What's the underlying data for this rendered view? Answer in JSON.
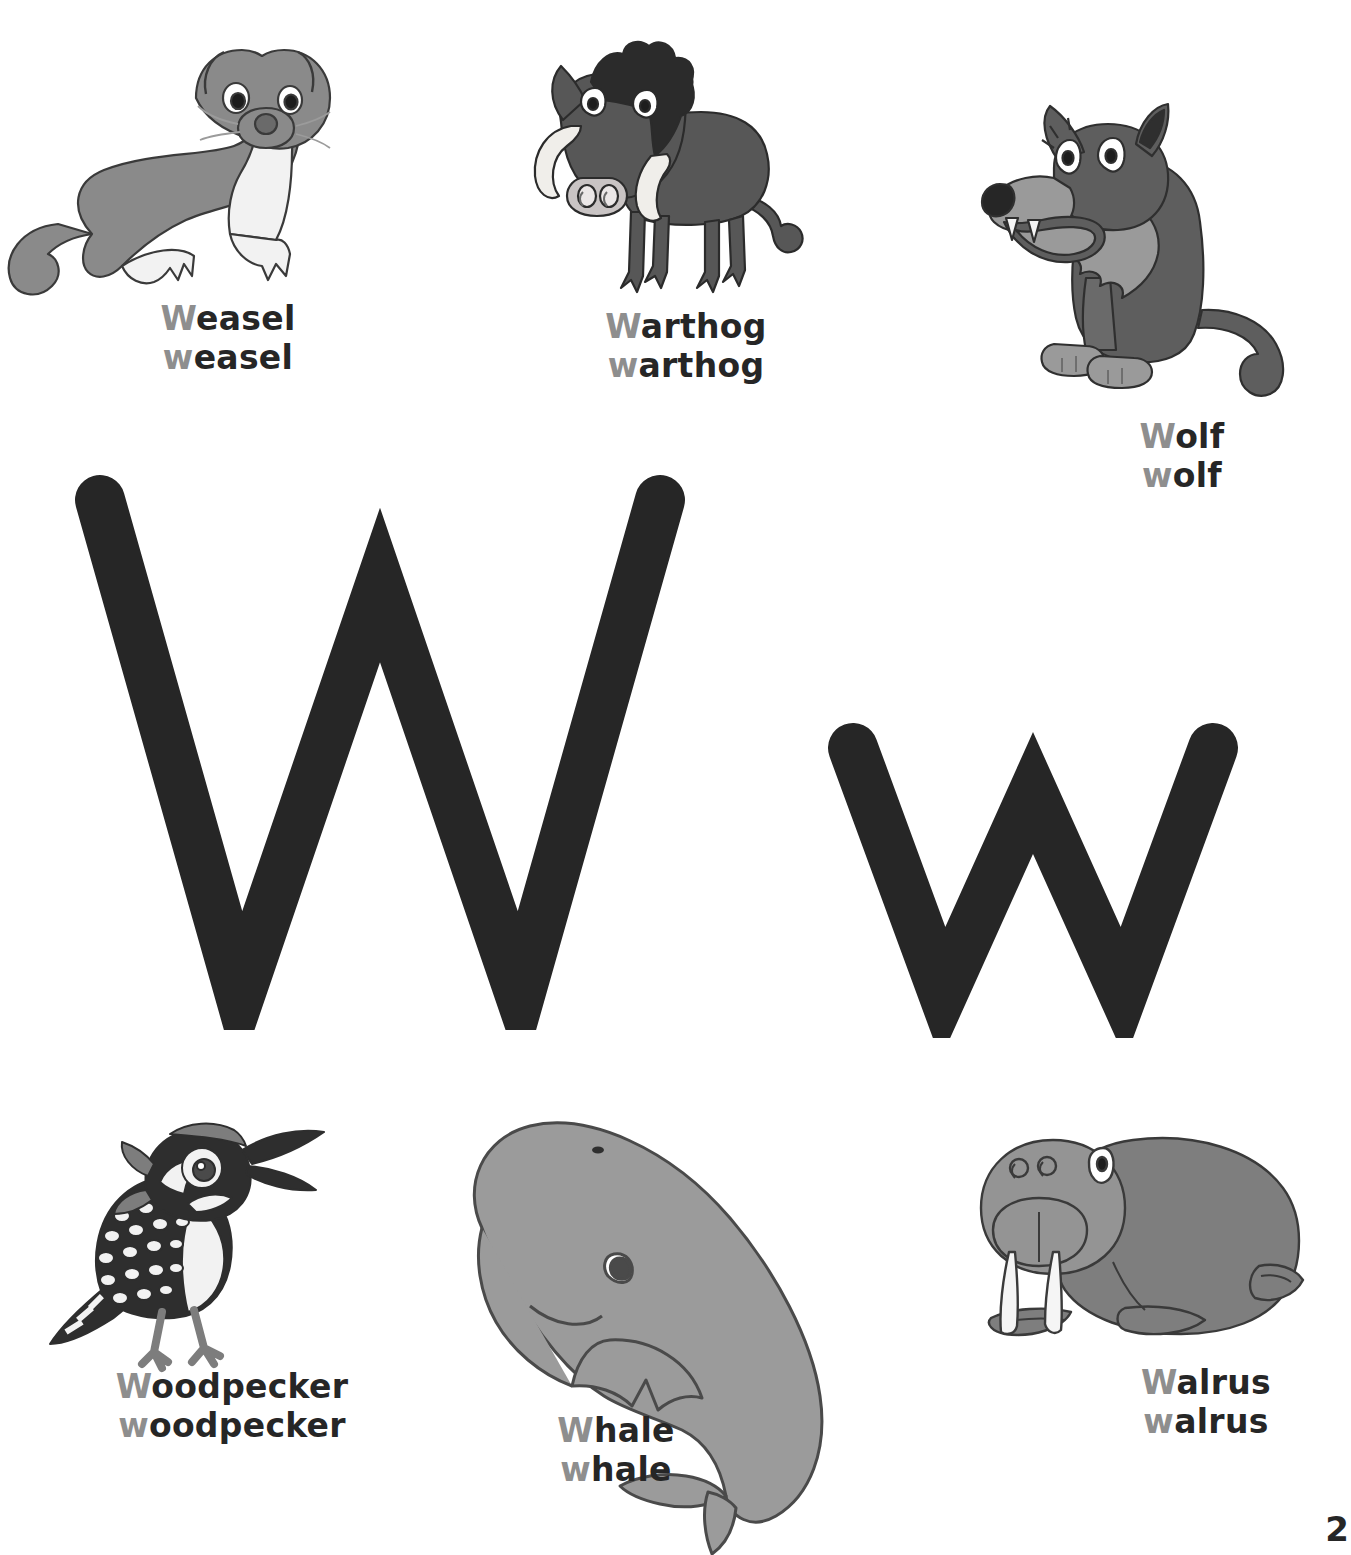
{
  "page": {
    "letter_uppercase": "W",
    "letter_lowercase": "w",
    "page_number": "2",
    "background_color": "#ffffff",
    "letter_color": "#262626",
    "initial_letter_color": "#8e8e8e",
    "word_color": "#262626"
  },
  "top_row": [
    {
      "id": "weasel",
      "icon": "weasel-illustration",
      "uppercase_initial": "W",
      "uppercase_rest": "easel",
      "lowercase_initial": "w",
      "lowercase_rest": "easel",
      "uppercase_word": "Weasel",
      "lowercase_word": "weasel",
      "body_color": "#8a8a8a",
      "belly_color": "#f2f2f2"
    },
    {
      "id": "warthog",
      "icon": "warthog-illustration",
      "uppercase_initial": "W",
      "uppercase_rest": "arthog",
      "lowercase_initial": "w",
      "lowercase_rest": "arthog",
      "uppercase_word": "Warthog",
      "lowercase_word": "warthog",
      "body_color": "#575757",
      "tusk_color": "#f0eeea",
      "mane_color": "#2b2b2b"
    },
    {
      "id": "wolf",
      "icon": "wolf-illustration",
      "uppercase_initial": "W",
      "uppercase_rest": "olf",
      "lowercase_initial": "w",
      "lowercase_rest": "olf",
      "uppercase_word": "Wolf",
      "lowercase_word": "wolf",
      "body_color": "#5e5e5e",
      "muzzle_color": "#9a9a9a"
    }
  ],
  "bottom_row": [
    {
      "id": "woodpecker",
      "icon": "woodpecker-illustration",
      "uppercase_initial": "W",
      "uppercase_rest": "oodpecker",
      "lowercase_initial": "w",
      "lowercase_rest": "oodpecker",
      "uppercase_word": "Woodpecker",
      "lowercase_word": "woodpecker",
      "body_color": "#2e2e2e",
      "spot_color": "#f2f2f2",
      "accent_color": "#7d7d7d"
    },
    {
      "id": "whale",
      "icon": "whale-illustration",
      "uppercase_initial": "W",
      "uppercase_rest": "hale",
      "lowercase_initial": "w",
      "lowercase_rest": "hale",
      "uppercase_word": "Whale",
      "lowercase_word": "whale",
      "body_color": "#9b9b9b"
    },
    {
      "id": "walrus",
      "icon": "walrus-illustration",
      "uppercase_initial": "W",
      "uppercase_rest": "alrus",
      "lowercase_initial": "w",
      "lowercase_rest": "alrus",
      "uppercase_word": "Walrus",
      "lowercase_word": "walrus",
      "body_color": "#7e7e7e",
      "head_color": "#949494",
      "tusk_color": "#f5f5f5"
    }
  ]
}
